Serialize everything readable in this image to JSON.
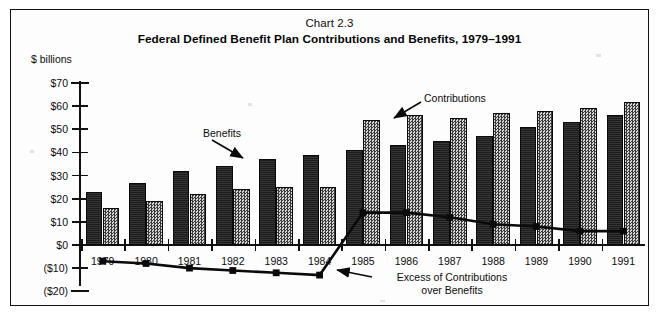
{
  "figure": {
    "chart_number": "Chart 2.3",
    "title": "Federal Defined Benefit Plan Contributions and Benefits, 1979–1991",
    "axis_unit": "$ billions"
  },
  "annotations": {
    "benefits_label": "Benefits",
    "contributions_label": "Contributions",
    "excess_label_line1": "Excess of Contributions",
    "excess_label_line2": "over Benefits"
  },
  "chart_data": {
    "type": "bar",
    "title": "Federal Defined Benefit Plan Contributions and Benefits, 1979–1991",
    "subtitle": "Chart 2.3",
    "xlabel": "",
    "ylabel": "$ billions",
    "ylim": [
      -20,
      70
    ],
    "ytick_labels": [
      "$70",
      "$60",
      "$50",
      "$40",
      "$30",
      "$20",
      "$10",
      "$0",
      "($10)",
      "($20)"
    ],
    "ytick_values": [
      70,
      60,
      50,
      40,
      30,
      20,
      10,
      0,
      -10,
      -20
    ],
    "grid": false,
    "legend": "annotated-callouts",
    "categories": [
      "1979",
      "1980",
      "1981",
      "1982",
      "1983",
      "1984",
      "1985",
      "1986",
      "1987",
      "1988",
      "1989",
      "1990",
      "1991"
    ],
    "series": [
      {
        "name": "Benefits",
        "kind": "bar",
        "style": "solid-dark",
        "values": [
          23,
          27,
          32,
          34,
          37,
          39,
          41,
          43,
          45,
          47,
          51,
          53,
          56
        ]
      },
      {
        "name": "Contributions",
        "kind": "bar",
        "style": "hatched-gray",
        "values": [
          16,
          19,
          22,
          24,
          25,
          25,
          54,
          56,
          55,
          57,
          58,
          59,
          62
        ]
      },
      {
        "name": "Excess of Contributions over Benefits",
        "kind": "line",
        "style": "black-line-square-markers",
        "values": [
          -7,
          -8,
          -10,
          -11,
          -12,
          -13,
          14,
          14,
          12,
          9,
          8,
          6,
          6
        ]
      }
    ]
  }
}
